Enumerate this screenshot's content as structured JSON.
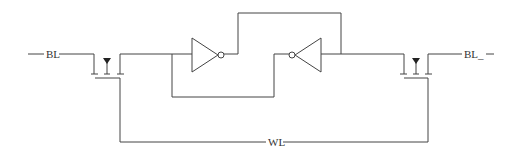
{
  "diagram": {
    "type": "6T SRAM cell schematic",
    "labels": {
      "bitline": "BL",
      "bitline_bar": "BL_",
      "wordline": "WL"
    },
    "components": [
      {
        "id": "access-transistor-left",
        "kind": "NMOS access transistor"
      },
      {
        "id": "inverter-left",
        "kind": "inverter",
        "direction": "right"
      },
      {
        "id": "inverter-right",
        "kind": "inverter",
        "direction": "left"
      },
      {
        "id": "access-transistor-right",
        "kind": "NMOS access transistor"
      }
    ],
    "colors": {
      "line": "#444444",
      "background": "#ffffff"
    }
  }
}
